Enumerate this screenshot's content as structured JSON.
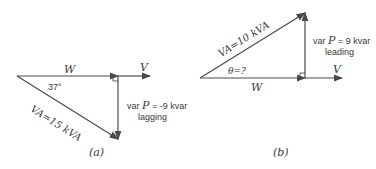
{
  "figure_a": {
    "caption": "(a)",
    "w_label": "W",
    "v_label": "V",
    "angle_label": "37°",
    "va_label": "VA=15 kVA",
    "var_prefix": "var ",
    "var_symbol": "P",
    "var_value": " = -9 kvar",
    "var_type": "lagging"
  },
  "figure_b": {
    "caption": "(b)",
    "w_label": "W",
    "v_label": "V",
    "angle_label": "θ=?",
    "va_label": "VA=10 kVA",
    "var_prefix": "var ",
    "var_symbol": "P",
    "var_value": " = 9 kvar",
    "var_type": "leading"
  },
  "colors": {
    "stroke": "#4a4a4a",
    "text": "#3a3a3a"
  }
}
